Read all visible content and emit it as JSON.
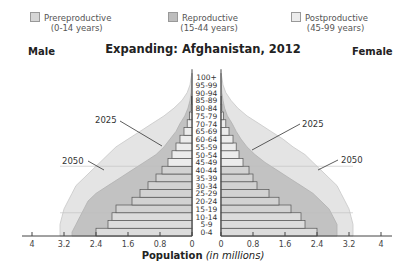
{
  "legend": {
    "items": [
      {
        "label": "Prereproductive",
        "sub": "(0-14 years)",
        "color": "#d6d6d6"
      },
      {
        "label": "Reproductive",
        "sub": "(15-44 years)",
        "color": "#bdbdbd"
      },
      {
        "label": "Postproductive",
        "sub": "(45-99 years)",
        "color": "#e6e6e6"
      }
    ]
  },
  "labels": {
    "male": "Male",
    "female": "Female",
    "title": "Expanding: Afghanistan, 2012",
    "xlabel_bold": "Population",
    "xlabel_italic": "(in millions)",
    "proj_2025": "2025",
    "proj_2050": "2050"
  },
  "chart_data": {
    "type": "bar",
    "subtype": "population-pyramid",
    "title": "Expanding: Afghanistan, 2012",
    "xlabel": "Population (in millions)",
    "ylabel": "Age group",
    "xlim": [
      -4,
      4
    ],
    "x_ticks_left": [
      "4",
      "3.2",
      "2.4",
      "1.6",
      "0.8",
      "0"
    ],
    "x_ticks_right": [
      "0",
      "0.8",
      "1.6",
      "2.4",
      "3.2",
      "4"
    ],
    "legend": [
      "Prereproductive (0-14 years)",
      "Reproductive (15-44 years)",
      "Postproductive (45-99 years)"
    ],
    "categories": [
      "0-4",
      "5-9",
      "10-14",
      "15-19",
      "20-24",
      "25-29",
      "30-34",
      "35-39",
      "40-44",
      "45-49",
      "50-54",
      "55-59",
      "60-64",
      "65-69",
      "70-74",
      "75-79",
      "80-84",
      "85-89",
      "90-94",
      "95-99",
      "100+"
    ],
    "series": [
      {
        "name": "Male 2012",
        "values": [
          2.4,
          2.1,
          2.0,
          1.9,
          1.5,
          1.3,
          1.1,
          0.9,
          0.75,
          0.6,
          0.5,
          0.4,
          0.3,
          0.2,
          0.12,
          0.06,
          0.02,
          0.01,
          0,
          0,
          0
        ]
      },
      {
        "name": "Female 2012",
        "values": [
          2.4,
          2.1,
          2.0,
          1.75,
          1.45,
          1.2,
          0.9,
          0.8,
          0.7,
          0.55,
          0.45,
          0.38,
          0.3,
          0.2,
          0.12,
          0.06,
          0.02,
          0.01,
          0,
          0,
          0
        ]
      },
      {
        "name": "Male 2025 (projected outline)",
        "values": [
          3.0,
          2.9,
          2.8,
          2.7,
          2.6,
          2.4,
          2.1,
          1.8,
          1.5,
          1.2,
          0.9,
          0.7,
          0.55,
          0.4,
          0.3,
          0.18,
          0.1,
          0.05,
          0.02,
          0.01,
          0
        ]
      },
      {
        "name": "Female 2025 (projected outline)",
        "values": [
          2.9,
          2.9,
          2.8,
          2.7,
          2.5,
          2.3,
          2.0,
          1.7,
          1.4,
          1.1,
          0.85,
          0.65,
          0.5,
          0.38,
          0.28,
          0.16,
          0.09,
          0.05,
          0.02,
          0.01,
          0
        ]
      },
      {
        "name": "Male 2050 (projected outline)",
        "values": [
          3.3,
          3.3,
          3.25,
          3.2,
          3.1,
          3.0,
          2.9,
          2.7,
          2.5,
          2.3,
          2.1,
          1.9,
          1.6,
          1.3,
          1.0,
          0.7,
          0.45,
          0.25,
          0.12,
          0.05,
          0.02
        ]
      },
      {
        "name": "Female 2050 (projected outline)",
        "values": [
          3.3,
          3.3,
          3.25,
          3.2,
          3.1,
          3.0,
          2.9,
          2.7,
          2.5,
          2.3,
          2.1,
          1.8,
          1.55,
          1.25,
          0.95,
          0.65,
          0.42,
          0.25,
          0.12,
          0.05,
          0.02
        ]
      }
    ],
    "annotations": [
      "2025",
      "2050",
      "Male",
      "Female"
    ],
    "grid": false
  }
}
